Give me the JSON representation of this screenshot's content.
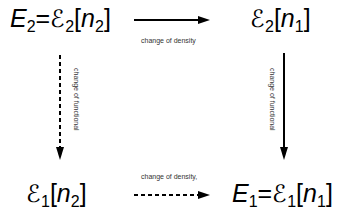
{
  "nodes": {
    "top_left": {
      "lhs": "E",
      "lhs_sub": "2",
      "eq": "=",
      "func": "ℰ",
      "func_sub": "2",
      "open": "[",
      "arg": "n",
      "arg_sub": "2",
      "close": "]"
    },
    "top_right": {
      "func": "ℰ",
      "func_sub": "2",
      "open": "[",
      "arg": "n",
      "arg_sub": "1",
      "close": "]"
    },
    "bottom_left": {
      "func": "ℰ",
      "func_sub": "1",
      "open": "[",
      "arg": "n",
      "arg_sub": "2",
      "close": "]"
    },
    "bottom_right": {
      "lhs": "E",
      "lhs_sub": "1",
      "eq": "=",
      "func": "ℰ",
      "func_sub": "1",
      "open": "[",
      "arg": "n",
      "arg_sub": "1",
      "close": "]"
    }
  },
  "edges": {
    "top": {
      "label": "change of density",
      "style": "solid"
    },
    "bottom": {
      "label": "change of density,",
      "style": "dashed"
    },
    "left": {
      "label": "change of functional",
      "style": "dashed"
    },
    "right": {
      "label": "change of functional",
      "style": "solid"
    }
  }
}
